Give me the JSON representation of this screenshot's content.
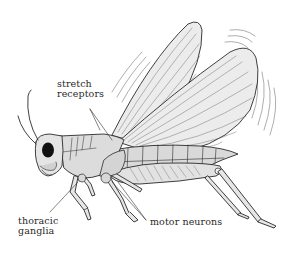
{
  "figure": {
    "labels": {
      "stretch_receptors": {
        "line1": "stretch",
        "line2": "receptors"
      },
      "thoracic_ganglia": {
        "line1": "thoracic",
        "line2": "ganglia"
      },
      "motor_neurons": {
        "line1": "motor neurons"
      }
    },
    "colors": {
      "ink": "#2a2a2a",
      "body_fill": "#d9d9d9",
      "wing_fill": "#ececec",
      "background": "#ffffff"
    }
  }
}
